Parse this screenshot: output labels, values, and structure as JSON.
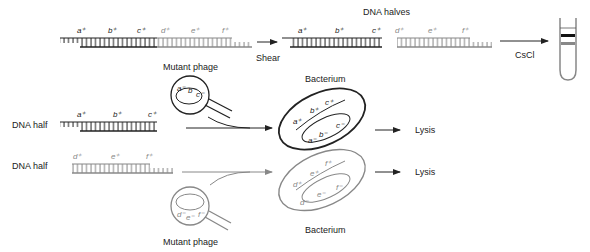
{
  "colors": {
    "dark_strand": "#222222",
    "light_strand": "#888888",
    "background": "#ffffff"
  },
  "top_row": {
    "genes_dark": [
      "a⁺",
      "b⁺",
      "c⁺"
    ],
    "genes_light": [
      "d⁺",
      "e⁺",
      "f⁺"
    ],
    "shear_label": "Shear",
    "halves_title": "DNA halves",
    "cscl_label": "CsCl"
  },
  "middle_row": {
    "row_label": "DNA half",
    "genes": [
      "a⁺",
      "b⁺",
      "c⁺"
    ],
    "phage_label": "Mutant phage",
    "phage_genes": [
      "a⁻",
      "b⁻",
      "c⁻"
    ],
    "bacterium_label": "Bacterium",
    "bacterium_plus": [
      "a⁺",
      "b⁺",
      "c⁺"
    ],
    "bacterium_minus": [
      "a⁻",
      "b⁻",
      "c⁻"
    ],
    "result": "Lysis"
  },
  "bottom_row": {
    "row_label": "DNA half",
    "genes": [
      "d⁺",
      "e⁺",
      "f⁺"
    ],
    "phage_label": "Mutant phage",
    "phage_genes": [
      "d⁻",
      "e⁻",
      "f⁻"
    ],
    "bacterium_label": "Bacterium",
    "bacterium_plus": [
      "d⁺",
      "e⁺",
      "f⁺"
    ],
    "bacterium_minus": [
      "d⁻",
      "e⁻",
      "f⁻"
    ],
    "result": "Lysis"
  }
}
